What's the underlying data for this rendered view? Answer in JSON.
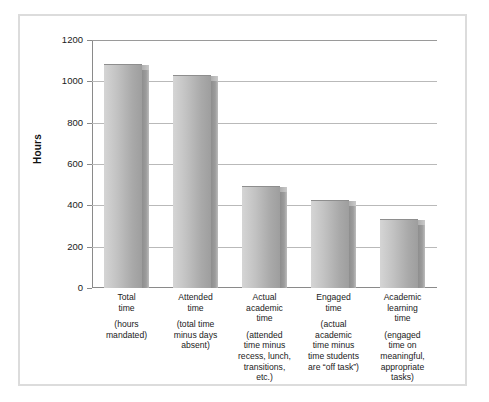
{
  "figure": {
    "background_color": "#ffffff",
    "border_color": "#dcdcdc"
  },
  "chart_data": {
    "type": "bar",
    "title": "",
    "xlabel": "",
    "ylabel": "Hours",
    "ylim": [
      0,
      1200
    ],
    "yticks": [
      0,
      200,
      400,
      600,
      800,
      1000,
      1200
    ],
    "ytick_labels": [
      "0",
      "200",
      "400",
      "600",
      "800",
      "1000",
      "1200"
    ],
    "grid": true,
    "legend": false,
    "bar_style": {
      "face_light": "#d5d5d5",
      "face_dark": "#9e9e9e",
      "side_color": "#8e8e8e",
      "outline": "#8e8e8e"
    },
    "categories": [
      "Total time (hours mandated)",
      "Attended time (total time minus days absent)",
      "Actual academic time (attended time minus recess, lunch, transitions, etc.)",
      "Engaged time (actual academic time minus time students are “off task”)",
      "Academic learning time (engaged time on meaningful, appropriate tasks)"
    ],
    "values": [
      1080,
      1025,
      490,
      420,
      330
    ],
    "category_labels": [
      {
        "main": "Total\ntime",
        "sub": "(hours\nmandated)"
      },
      {
        "main": "Attended\ntime",
        "sub": "(total time\nminus days\nabsent)"
      },
      {
        "main": "Actual\nacademic\ntime",
        "sub": "(attended\ntime minus\nrecess, lunch,\ntransitions,\netc.)"
      },
      {
        "main": "Engaged\ntime",
        "sub": "(actual\nacademic\ntime minus\ntime students\nare “off task”)"
      },
      {
        "main": "Academic\nlearning\ntime",
        "sub": "(engaged\ntime on\nmeaningful,\nappropriate\ntasks)"
      }
    ]
  }
}
